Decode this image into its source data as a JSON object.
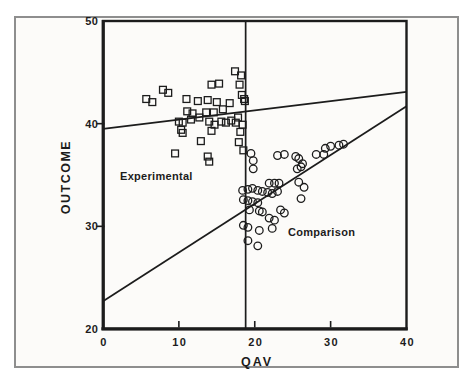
{
  "figure": {
    "xlabel": "QAV",
    "ylabel": "OUTCOME",
    "region_labels": {
      "experimental": "Experimental",
      "comparison": "Comparison"
    }
  },
  "colors": {
    "ink": "#1c1c1c",
    "frame": "#8e8e8e",
    "paper": "#fcfbf9"
  },
  "chart_data": {
    "type": "scatter",
    "title": "",
    "xlabel": "QAV",
    "ylabel": "OUTCOME",
    "xlim": [
      0,
      40
    ],
    "ylim": [
      20,
      50
    ],
    "x_ticks": [
      0,
      10,
      20,
      30,
      40
    ],
    "y_ticks": [
      20,
      30,
      40,
      50
    ],
    "grid": false,
    "divider_x": 18.8,
    "series": [
      {
        "name": "Experimental",
        "marker": "square",
        "label_text": "Experimental",
        "fit_line": {
          "x": [
            0,
            40
          ],
          "y": [
            39.5,
            43.1
          ]
        },
        "points": [
          [
            17.4,
            45.1
          ],
          [
            18.2,
            44.7
          ],
          [
            15.3,
            43.9
          ],
          [
            14.3,
            43.8
          ],
          [
            18.0,
            43.8
          ],
          [
            7.9,
            43.3
          ],
          [
            8.6,
            43.0
          ],
          [
            18.3,
            42.8
          ],
          [
            5.7,
            42.4
          ],
          [
            11.0,
            42.4
          ],
          [
            18.6,
            42.4
          ],
          [
            12.5,
            42.2
          ],
          [
            13.8,
            42.3
          ],
          [
            15.0,
            42.1
          ],
          [
            6.5,
            42.1
          ],
          [
            18.7,
            42.2
          ],
          [
            16.7,
            42.0
          ],
          [
            11.1,
            41.2
          ],
          [
            11.8,
            41.0
          ],
          [
            13.6,
            41.1
          ],
          [
            14.6,
            41.1
          ],
          [
            15.8,
            41.4
          ],
          [
            12.7,
            40.6
          ],
          [
            17.8,
            40.6
          ],
          [
            11.6,
            40.4
          ],
          [
            16.9,
            40.3
          ],
          [
            10.0,
            40.2
          ],
          [
            14.0,
            40.2
          ],
          [
            15.6,
            40.2
          ],
          [
            10.5,
            40.1
          ],
          [
            16.2,
            40.1
          ],
          [
            17.5,
            40.1
          ],
          [
            14.7,
            39.9
          ],
          [
            18.4,
            39.9
          ],
          [
            10.3,
            39.4
          ],
          [
            14.3,
            39.3
          ],
          [
            18.1,
            39.2
          ],
          [
            10.5,
            39.1
          ],
          [
            12.9,
            38.3
          ],
          [
            17.9,
            38.2
          ],
          [
            18.5,
            37.4
          ],
          [
            9.5,
            37.1
          ],
          [
            13.8,
            36.8
          ],
          [
            14.0,
            36.3
          ]
        ]
      },
      {
        "name": "Comparison",
        "marker": "circle",
        "label_text": "Comparison",
        "fit_line": {
          "x": [
            0,
            40
          ],
          "y": [
            22.7,
            41.7
          ]
        },
        "points": [
          [
            31.7,
            38.0
          ],
          [
            31.1,
            37.9
          ],
          [
            30.0,
            37.8
          ],
          [
            29.3,
            37.6
          ],
          [
            19.5,
            37.1
          ],
          [
            23.9,
            37.0
          ],
          [
            28.1,
            37.0
          ],
          [
            29.1,
            37.0
          ],
          [
            23.0,
            36.9
          ],
          [
            25.4,
            36.8
          ],
          [
            25.8,
            36.6
          ],
          [
            19.8,
            36.4
          ],
          [
            26.3,
            36.1
          ],
          [
            26.1,
            35.8
          ],
          [
            25.6,
            35.6
          ],
          [
            19.8,
            35.6
          ],
          [
            25.8,
            34.3
          ],
          [
            21.9,
            34.2
          ],
          [
            22.6,
            34.2
          ],
          [
            23.2,
            34.2
          ],
          [
            26.5,
            33.8
          ],
          [
            19.7,
            33.7
          ],
          [
            19.1,
            33.6
          ],
          [
            18.4,
            33.5
          ],
          [
            20.4,
            33.5
          ],
          [
            21.0,
            33.4
          ],
          [
            23.0,
            33.4
          ],
          [
            21.7,
            33.3
          ],
          [
            22.3,
            33.2
          ],
          [
            26.1,
            32.7
          ],
          [
            18.5,
            32.6
          ],
          [
            19.1,
            32.5
          ],
          [
            19.7,
            32.4
          ],
          [
            20.4,
            32.3
          ],
          [
            19.3,
            31.6
          ],
          [
            23.4,
            31.6
          ],
          [
            20.6,
            31.5
          ],
          [
            21.0,
            31.4
          ],
          [
            23.9,
            31.3
          ],
          [
            21.9,
            30.8
          ],
          [
            22.6,
            30.6
          ],
          [
            18.5,
            30.1
          ],
          [
            19.1,
            29.9
          ],
          [
            22.3,
            29.8
          ],
          [
            20.6,
            29.6
          ],
          [
            19.1,
            28.6
          ],
          [
            20.4,
            28.1
          ]
        ]
      }
    ]
  }
}
